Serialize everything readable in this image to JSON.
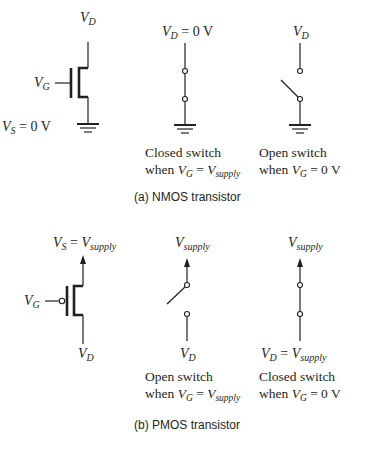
{
  "figure": {
    "nmos": {
      "caption": "(a) NMOS transistor",
      "transistor": {
        "drain_label": {
          "main": "V",
          "sub": "D"
        },
        "gate_label": {
          "main": "V",
          "sub": "G"
        },
        "source_label": {
          "main": "V",
          "sub": "S",
          "rest": " = 0 V"
        }
      },
      "closed_switch": {
        "top_label": {
          "main": "V",
          "sub": "D",
          "rest": " = 0 V"
        },
        "line1": "Closed switch",
        "line2": {
          "prefix": "when ",
          "main": "V",
          "sub": "G",
          "eq": " = ",
          "main2": "V",
          "sub2": "supply"
        }
      },
      "open_switch": {
        "top_label": {
          "main": "V",
          "sub": "D"
        },
        "line1": "Open switch",
        "line2": {
          "prefix": "when ",
          "main": "V",
          "sub": "G",
          "eq": " = 0 V"
        }
      }
    },
    "pmos": {
      "caption": "(b) PMOS transistor",
      "transistor": {
        "source_label": {
          "main": "V",
          "sub": "S",
          "eq": " = ",
          "main2": "V",
          "sub2": "supply"
        },
        "gate_label": {
          "main": "V",
          "sub": "G"
        },
        "drain_label": {
          "main": "V",
          "sub": "D"
        }
      },
      "open_switch": {
        "top_label": {
          "main": "V",
          "sub": "supply"
        },
        "bottom_label": {
          "main": "V",
          "sub": "D"
        },
        "line1": "Open switch",
        "line2": {
          "prefix": "when ",
          "main": "V",
          "sub": "G",
          "eq": " = ",
          "main2": "V",
          "sub2": "supply"
        }
      },
      "closed_switch": {
        "top_label": {
          "main": "V",
          "sub": "supply"
        },
        "bottom_label": {
          "main": "V",
          "sub": "D",
          "eq": " = ",
          "main2": "V",
          "sub2": "supply"
        },
        "line1": "Closed switch",
        "line2": {
          "prefix": "when ",
          "main": "V",
          "sub": "G",
          "eq": " = 0 V"
        }
      }
    }
  }
}
